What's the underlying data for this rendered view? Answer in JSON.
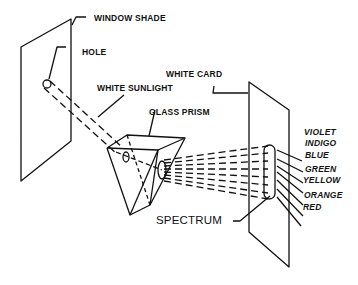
{
  "diagram": {
    "labels": {
      "window_shade": "WINDOW SHADE",
      "hole": "HOLE",
      "white_sunlight": "WHITE SUNLIGHT",
      "white_card": "WHITE CARD",
      "glass_prism": "GLASS PRISM",
      "spectrum": "SPECTRUM"
    },
    "colors": [
      "VIOLET",
      "INDIGO",
      "BLUE",
      "GREEN",
      "YELLOW",
      "ORANGE",
      "RED"
    ],
    "line_color": "#111111",
    "background": "#ffffff"
  }
}
